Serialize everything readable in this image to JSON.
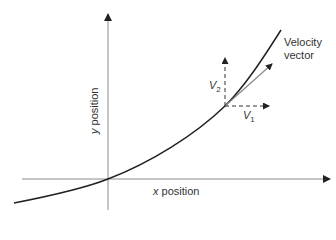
{
  "diagram": {
    "title": "",
    "axes": {
      "x_label_var": "x",
      "x_label_rest": " position",
      "y_label_var": "y",
      "y_label_rest": " position"
    },
    "curve": {
      "description": "exponential-like increasing trajectory through origin"
    },
    "vectors": {
      "velocity_label_line1": "Velocity",
      "velocity_label_line2": "vector",
      "v2_var": "V",
      "v2_sub": "2",
      "v1_var": "V",
      "v1_sub": "1"
    },
    "colors": {
      "axis": "#888888",
      "curve": "#222222",
      "velocity_vector": "#888888",
      "components": "#333333"
    }
  }
}
